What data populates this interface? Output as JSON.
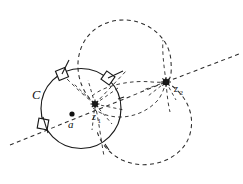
{
  "figure": {
    "type": "geometric-diagram",
    "background_color": "#ffffff",
    "stroke_color": "#1a1a1a"
  },
  "labels": {
    "curve_c": "C",
    "center_a": "a",
    "point_z1": "z",
    "point_z1_sub": "1",
    "point_z2": "z",
    "point_z2_sub": "2"
  },
  "geometry": {
    "circle_c": {
      "cx": 81,
      "cy": 108.5,
      "r": 40
    },
    "point_a": {
      "x": 72,
      "y": 114
    },
    "point_z1": {
      "x": 95,
      "y": 104
    },
    "point_z2": {
      "x": 166,
      "y": 82
    },
    "markers": [
      {
        "name": "marker-top-left",
        "x": 62,
        "y": 74,
        "angle": -27
      },
      {
        "name": "marker-top-right",
        "x": 107,
        "y": 77,
        "angle": 38
      },
      {
        "name": "marker-left",
        "x": 42,
        "y": 124,
        "angle": 12
      }
    ],
    "dashed_loop_top": {
      "cx": 122,
      "cy": 68,
      "rx": 47,
      "ry": 45
    },
    "dashed_loop_bottom": {
      "cx": 145,
      "cy": 130,
      "rx": 48,
      "ry": 46
    },
    "dashed_arc_mid": {
      "cx": 128,
      "cy": 99,
      "rx": 40,
      "ry": 22
    },
    "ray_through_z1": {
      "x1": 12,
      "y1": 143,
      "x2": 152,
      "y2": 86
    },
    "ray_from_z2": {
      "x1": 166,
      "y1": 82,
      "x2": 238,
      "y2": 55
    }
  },
  "colors": {
    "ink": "#1a1a1a",
    "dashed_ink": "#2b2b2b",
    "paper": "#ffffff"
  }
}
